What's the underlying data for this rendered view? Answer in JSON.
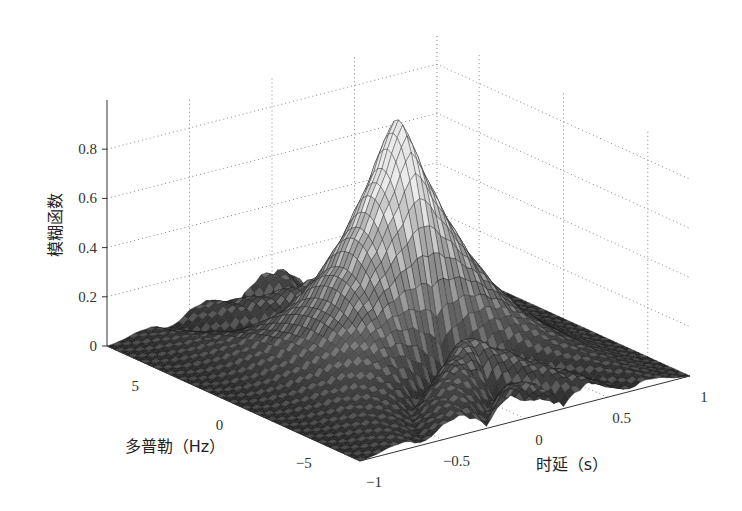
{
  "chart_data": {
    "type": "surface3d",
    "title": "",
    "xlabel": "时延（s）",
    "ylabel": "多普勒（Hz）",
    "zlabel": "模糊函数",
    "x_ticks": [
      "-1",
      "-0.5",
      "0",
      "0.5",
      "1"
    ],
    "x_tick_values": [
      -1,
      -0.5,
      0,
      0.5,
      1
    ],
    "y_ticks": [
      "5",
      "0",
      "-5"
    ],
    "y_tick_values": [
      5,
      0,
      -5
    ],
    "z_ticks": [
      "0",
      "0.2",
      "0.4",
      "0.6",
      "0.8"
    ],
    "z_tick_values": [
      0,
      0.2,
      0.4,
      0.6,
      0.8
    ],
    "xlim": [
      -1,
      1
    ],
    "ylim": [
      -7.5,
      7.5
    ],
    "zlim": [
      0,
      0.8
    ],
    "peak": {
      "x": 0,
      "y": 0,
      "z": 1.0
    },
    "grid": true,
    "colormap": "gray"
  }
}
